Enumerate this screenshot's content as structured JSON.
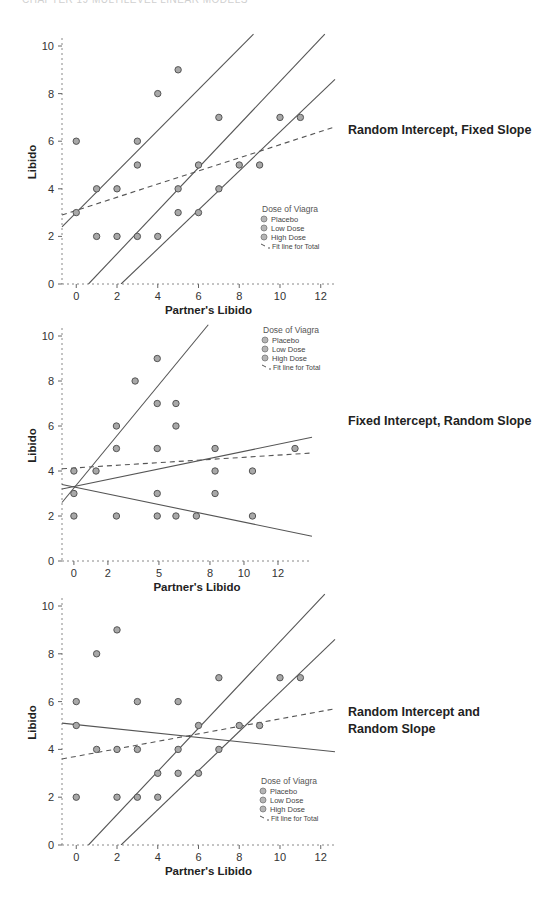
{
  "page": {
    "running_header": "CHAPTER 19 MULTILEVEL LINEAR MODELS"
  },
  "legend": {
    "title": "Dose of Viagra",
    "items": [
      "Placebo",
      "Low Dose",
      "High Dose",
      "Fit line for Total"
    ]
  },
  "axes": {
    "xlabel": "Partner's Libido",
    "ylabel": "Libido"
  },
  "panels": [
    {
      "label": "Random Intercept, Fixed Slope"
    },
    {
      "label": "Fixed Intercept, Random Slope"
    },
    {
      "label": "Random Intercept and Random Slope"
    }
  ],
  "chart_data": [
    {
      "type": "scatter",
      "title": "Random Intercept, Fixed Slope",
      "xlabel": "Partner's Libido",
      "ylabel": "Libido",
      "xlim": [
        -0.7,
        12.7
      ],
      "ylim": [
        0,
        10.5
      ],
      "xticks": [
        0,
        2,
        4,
        6,
        8,
        10,
        12
      ],
      "yticks": [
        0,
        2,
        4,
        6,
        8,
        10
      ],
      "legend_title": "Dose of Viagra",
      "legend": [
        "Placebo",
        "Low Dose",
        "High Dose",
        "Fit line for Total"
      ],
      "legend_position": "lower right",
      "points": [
        [
          0,
          6
        ],
        [
          0,
          3
        ],
        [
          1,
          4
        ],
        [
          1,
          2
        ],
        [
          2,
          4
        ],
        [
          2,
          2
        ],
        [
          3,
          6
        ],
        [
          3,
          5
        ],
        [
          3,
          2
        ],
        [
          4,
          8
        ],
        [
          4,
          2
        ],
        [
          5,
          9
        ],
        [
          5,
          4
        ],
        [
          5,
          3
        ],
        [
          6,
          5
        ],
        [
          6,
          3
        ],
        [
          7,
          7
        ],
        [
          7,
          4
        ],
        [
          8,
          5
        ],
        [
          9,
          5
        ],
        [
          10,
          7
        ],
        [
          11,
          7
        ]
      ],
      "lines": [
        {
          "name": "group 1",
          "style": "solid",
          "from": [
            -0.7,
            2.4
          ],
          "to": [
            8.7,
            10.5
          ]
        },
        {
          "name": "group 2",
          "style": "solid",
          "from": [
            0.6,
            0
          ],
          "to": [
            12.2,
            10.5
          ]
        },
        {
          "name": "group 3",
          "style": "solid",
          "from": [
            2.2,
            0
          ],
          "to": [
            12.7,
            8.6
          ]
        },
        {
          "name": "Fit line for Total",
          "style": "dashed",
          "from": [
            -0.7,
            2.9
          ],
          "to": [
            12.7,
            6.6
          ]
        }
      ]
    },
    {
      "type": "scatter",
      "title": "Fixed Intercept, Random Slope",
      "xlabel": "Partner's Libido",
      "ylabel": "Libido",
      "xlim": [
        -0.7,
        14
      ],
      "ylim": [
        0,
        10.5
      ],
      "xticks": [
        0,
        2,
        5,
        8,
        10,
        12
      ],
      "yticks": [
        0,
        2,
        4,
        6,
        8,
        10
      ],
      "legend_title": "Dose of Viagra",
      "legend": [
        "Placebo",
        "Low Dose",
        "High Dose",
        "Fit line for Total"
      ],
      "legend_position": "upper right",
      "points": [
        [
          0,
          4
        ],
        [
          0,
          3
        ],
        [
          0,
          2
        ],
        [
          1.3,
          4
        ],
        [
          2.5,
          6
        ],
        [
          2.5,
          5
        ],
        [
          2.5,
          2
        ],
        [
          3.6,
          8
        ],
        [
          4.9,
          9
        ],
        [
          4.9,
          7
        ],
        [
          4.9,
          5
        ],
        [
          4.9,
          3
        ],
        [
          4.9,
          2
        ],
        [
          6,
          7
        ],
        [
          6,
          6
        ],
        [
          6,
          2
        ],
        [
          7.2,
          2
        ],
        [
          8.3,
          5
        ],
        [
          8.3,
          4
        ],
        [
          8.3,
          3
        ],
        [
          10.5,
          4
        ],
        [
          10.5,
          2
        ],
        [
          13,
          5
        ],
        [
          14.7,
          7
        ]
      ],
      "lines": [
        {
          "name": "steep slope",
          "style": "solid",
          "from": [
            -0.7,
            2.6
          ],
          "to": [
            7.9,
            10.5
          ]
        },
        {
          "name": "shallow positive slope",
          "style": "solid",
          "from": [
            -0.7,
            3.2
          ],
          "to": [
            14,
            5.5
          ]
        },
        {
          "name": "negative slope",
          "style": "solid",
          "from": [
            -0.7,
            3.4
          ],
          "to": [
            14,
            1.1
          ]
        },
        {
          "name": "Fit line for Total",
          "style": "dashed",
          "from": [
            -0.7,
            4.1
          ],
          "to": [
            14,
            4.8
          ]
        }
      ]
    },
    {
      "type": "scatter",
      "title": "Random Intercept and Random Slope",
      "xlabel": "Partner's Libido",
      "ylabel": "Libido",
      "xlim": [
        -0.7,
        12.7
      ],
      "ylim": [
        0,
        10.5
      ],
      "xticks": [
        0,
        2,
        4,
        6,
        8,
        10,
        12
      ],
      "yticks": [
        0,
        2,
        4,
        6,
        8,
        10
      ],
      "legend_title": "Dose of Viagra",
      "legend": [
        "Placebo",
        "Low Dose",
        "High Dose",
        "Fit line for Total"
      ],
      "legend_position": "lower right",
      "points": [
        [
          0,
          6
        ],
        [
          0,
          5
        ],
        [
          0,
          2
        ],
        [
          1,
          8
        ],
        [
          1,
          4
        ],
        [
          2,
          9
        ],
        [
          2,
          4
        ],
        [
          2,
          2
        ],
        [
          3,
          6
        ],
        [
          3,
          4
        ],
        [
          3,
          2
        ],
        [
          4,
          3
        ],
        [
          4,
          2
        ],
        [
          5,
          6
        ],
        [
          5,
          4
        ],
        [
          5,
          3
        ],
        [
          6,
          5
        ],
        [
          6,
          3
        ],
        [
          7,
          7
        ],
        [
          7,
          4
        ],
        [
          8,
          5
        ],
        [
          9,
          5
        ],
        [
          10,
          7
        ],
        [
          11,
          7
        ]
      ],
      "lines": [
        {
          "name": "negative slope",
          "style": "solid",
          "from": [
            -0.7,
            5.1
          ],
          "to": [
            12.7,
            3.9
          ]
        },
        {
          "name": "group 2",
          "style": "solid",
          "from": [
            0.6,
            0
          ],
          "to": [
            12.2,
            10.5
          ]
        },
        {
          "name": "group 3",
          "style": "solid",
          "from": [
            2.2,
            0
          ],
          "to": [
            12.7,
            8.6
          ]
        },
        {
          "name": "Fit line for Total",
          "style": "dashed",
          "from": [
            -0.7,
            3.6
          ],
          "to": [
            12.7,
            5.7
          ]
        }
      ]
    }
  ]
}
